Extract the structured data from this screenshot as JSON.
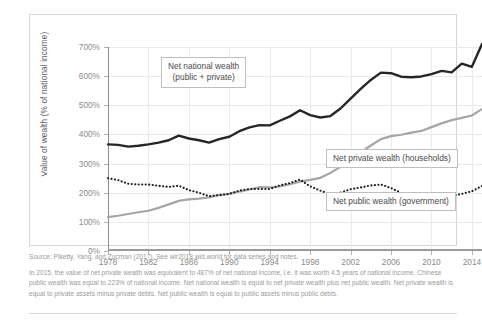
{
  "chart_data": {
    "type": "line",
    "title": "",
    "xlabel": "",
    "ylabel": "Value of wealth (% of national income)",
    "xlim": [
      1978,
      2015
    ],
    "ylim": [
      0,
      700
    ],
    "grid": true,
    "legend_position": "inline-callouts",
    "y_ticks": [
      "0%",
      "100%",
      "200%",
      "300%",
      "400%",
      "500%",
      "600%",
      "700%"
    ],
    "y_tick_values": [
      0,
      100,
      200,
      300,
      400,
      500,
      600,
      700
    ],
    "x_ticks": [
      "1978",
      "1982",
      "1986",
      "1990",
      "1994",
      "1998",
      "2002",
      "2006",
      "2010",
      "2014"
    ],
    "x_tick_values": [
      1978,
      1982,
      1986,
      1990,
      1994,
      1998,
      2002,
      2006,
      2010,
      2014
    ],
    "x": [
      1978,
      1979,
      1980,
      1981,
      1982,
      1983,
      1984,
      1985,
      1986,
      1987,
      1988,
      1989,
      1990,
      1991,
      1992,
      1993,
      1994,
      1995,
      1996,
      1997,
      1998,
      1999,
      2000,
      2001,
      2002,
      2003,
      2004,
      2005,
      2006,
      2007,
      2008,
      2009,
      2010,
      2011,
      2012,
      2013,
      2014,
      2015
    ],
    "series": [
      {
        "name": "Net national wealth (public + private)",
        "style": "solid-black",
        "color": "#262626",
        "values": [
          366,
          364,
          358,
          361,
          366,
          372,
          380,
          396,
          386,
          380,
          372,
          384,
          392,
          411,
          424,
          432,
          431,
          447,
          462,
          483,
          466,
          458,
          463,
          489,
          523,
          556,
          587,
          612,
          610,
          598,
          596,
          599,
          607,
          618,
          613,
          643,
          632,
          710
        ]
      },
      {
        "name": "Net private wealth (households)",
        "style": "solid-gray",
        "color": "#a6a6a6",
        "values": [
          116,
          121,
          127,
          133,
          138,
          148,
          160,
          172,
          177,
          180,
          184,
          192,
          196,
          204,
          211,
          219,
          218,
          222,
          229,
          238,
          244,
          251,
          268,
          289,
          311,
          338,
          362,
          384,
          394,
          399,
          406,
          412,
          425,
          438,
          449,
          457,
          465,
          487
        ]
      },
      {
        "name": "Net public wealth (government)",
        "style": "dotted-black",
        "color": "#1f1f1f",
        "values": [
          250,
          243,
          231,
          228,
          228,
          224,
          220,
          224,
          209,
          200,
          188,
          192,
          196,
          207,
          213,
          213,
          213,
          225,
          233,
          245,
          222,
          207,
          195,
          200,
          212,
          218,
          225,
          228,
          216,
          199,
          190,
          187,
          182,
          196,
          189,
          196,
          205,
          223
        ]
      }
    ],
    "callouts": [
      {
        "id": "national",
        "line1": "Net national wealth",
        "line2": "(public + private)"
      },
      {
        "id": "private",
        "line1": "Net private wealth (households)",
        "line2": ""
      },
      {
        "id": "public",
        "line1": "Net public wealth (government)",
        "line2": ""
      }
    ]
  },
  "footnote": {
    "source": "Source: Piketty, Yang, and Zucman (2017). See wir2018.wid.world for data series and notes.",
    "note": "In 2015, the value of net private wealth was equivalent to 487% of net national income, i.e. it was worth 4.5 years of national income. Chinese public wealth was equal to 223% of national income. Net national wealth is equal to net private wealth plus net public wealth. Net private wealth is equal to private assets minus private debts. Net public wealth is equal to public assets minus public debts."
  }
}
